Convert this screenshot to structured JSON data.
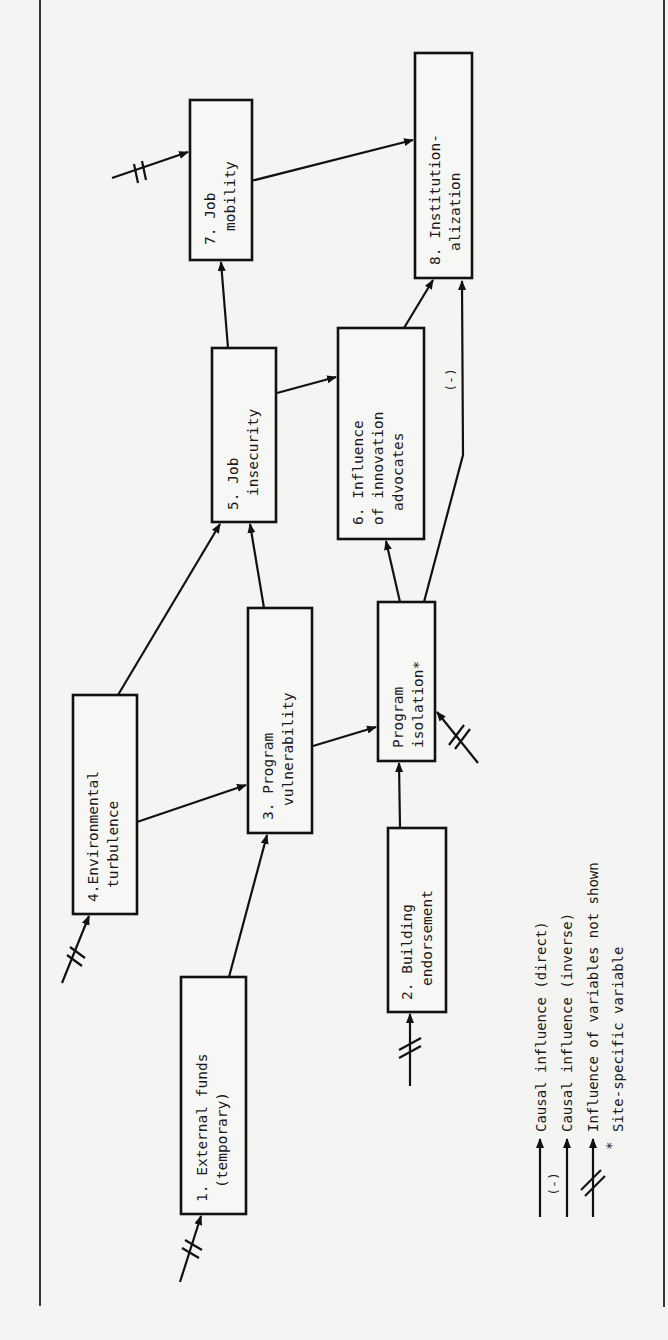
{
  "nodes": [
    {
      "id": 1,
      "line1": "1. External funds",
      "line2": "(temporary)"
    },
    {
      "id": 2,
      "line1": "2. Building",
      "line2": "endorsement"
    },
    {
      "id": 3,
      "line1": "3. Program",
      "line2": "vulnerability"
    },
    {
      "id": 4,
      "line1": "4.Environmental",
      "line2": "turbulence"
    },
    {
      "id": 5,
      "line1": "5. Job",
      "line2": "insecurity"
    },
    {
      "id": 6,
      "line1": "6. Influence",
      "line2": "of innovation",
      "line3": "advocates"
    },
    {
      "id": 7,
      "line1": "7. Job",
      "line2": "mobility"
    },
    {
      "id": 8,
      "line1": "8. Institution-",
      "line2": "alization"
    },
    {
      "id": "iso",
      "line1": "Program",
      "line2": "isolation*"
    }
  ],
  "edges": [
    {
      "from": 1,
      "to": 3,
      "type": "direct"
    },
    {
      "from": 4,
      "to": 3,
      "type": "direct"
    },
    {
      "from": 4,
      "to": 5,
      "type": "direct"
    },
    {
      "from": 3,
      "to": 5,
      "type": "direct"
    },
    {
      "from": 3,
      "to": "iso",
      "type": "direct"
    },
    {
      "from": 2,
      "to": "iso",
      "type": "direct"
    },
    {
      "from": "iso",
      "to": 6,
      "type": "direct"
    },
    {
      "from": "iso",
      "to": 8,
      "type": "inverse"
    },
    {
      "from": 5,
      "to": 6,
      "type": "direct"
    },
    {
      "from": 5,
      "to": 7,
      "type": "direct"
    },
    {
      "from": 6,
      "to": 8,
      "type": "direct"
    },
    {
      "from": 7,
      "to": 8,
      "type": "direct"
    }
  ],
  "exogenous_inputs": [
    1,
    2,
    4,
    7,
    "iso"
  ],
  "inverse_marker": "(-)",
  "legend": {
    "direct": "Causal influence (direct)",
    "inverse": "Causal influence (inverse)",
    "not_shown": "Influence of variables not shown",
    "site_specific_symbol": "*",
    "site_specific": "Site-specific variable",
    "inverse_marker": "(-)"
  }
}
